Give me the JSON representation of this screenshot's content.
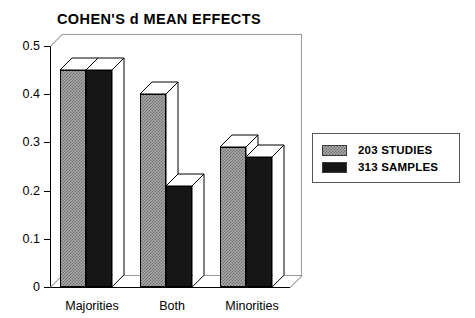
{
  "chart_data": {
    "type": "bar",
    "title": "COHEN'S d MEAN EFFECTS",
    "xlabel": "",
    "ylabel": "",
    "ylim": [
      0,
      0.5
    ],
    "yticks": [
      "0",
      "0.1",
      "0.2",
      "0.3",
      "0.4",
      "0.5"
    ],
    "ytick_values": [
      0,
      0.1,
      0.2,
      0.3,
      0.4,
      0.5
    ],
    "categories": [
      "Majorities",
      "Both",
      "Minorities"
    ],
    "grid": false,
    "legend_position": "right",
    "three_d": true,
    "series": [
      {
        "name": "203 STUDIES",
        "color": "#a9a9a9",
        "pattern": "dithered-gray",
        "values": [
          0.45,
          0.4,
          0.29
        ]
      },
      {
        "name": "313 SAMPLES",
        "color": "#161616",
        "pattern": "solid-black",
        "values": [
          0.45,
          0.21,
          0.27
        ]
      }
    ]
  },
  "legend": {
    "entries": [
      {
        "label": "203 STUDIES",
        "swatch": "gray-hatch-swatch"
      },
      {
        "label": "313 SAMPLES",
        "swatch": "black-swatch"
      }
    ]
  }
}
